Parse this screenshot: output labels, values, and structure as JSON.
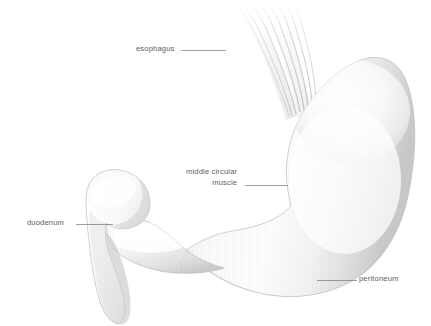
{
  "figure": {
    "background_color": "#ffffff",
    "label_color": "#5d5d5f",
    "leader_line_color": "#6e6e70",
    "organ_outline_color": "#b9b9bb",
    "organ_fill_light": "#ffffff",
    "organ_fill_shade": "#d8d8da"
  },
  "labels": {
    "esophagus": "esophagus",
    "middle_circular_muscle_line1": "middle circular",
    "middle_circular_muscle_line2": "muscle",
    "duodenum": "duodenum",
    "peritoneum": "peritoneum"
  },
  "structures": [
    {
      "name": "esophagus",
      "description": "tapering muscular tube of fine longitudinal fibers entering the cardia from upper left"
    },
    {
      "name": "fundus-and-body",
      "description": "large rounded sac forming the right mass of the stomach"
    },
    {
      "name": "lesser-curvature",
      "description": "concave inner border of the stomach"
    },
    {
      "name": "greater-curvature",
      "description": "convex outer lower border of the stomach"
    },
    {
      "name": "pyloric-antrum",
      "description": "narrowed bulbous segment leading to the pylorus"
    },
    {
      "name": "duodenum",
      "description": "hooked C-shaped first portion of small intestine at lower left"
    },
    {
      "name": "peritoneum",
      "description": "serous membrane covering of the lower greater curvature"
    }
  ],
  "leader_lines": [
    {
      "name": "esophagus-leader",
      "x1": 181,
      "y1": 50.5,
      "x2": 226,
      "y2": 50.5
    },
    {
      "name": "middle-circular-muscle-leader",
      "x1": 245,
      "y1": 185.5,
      "x2": 288,
      "y2": 185.5
    },
    {
      "name": "duodenum-leader",
      "x1": 76,
      "y1": 224.5,
      "x2": 113,
      "y2": 224.5
    },
    {
      "name": "peritoneum-leader",
      "x1": 317,
      "y1": 280.5,
      "x2": 357,
      "y2": 280.5
    }
  ]
}
